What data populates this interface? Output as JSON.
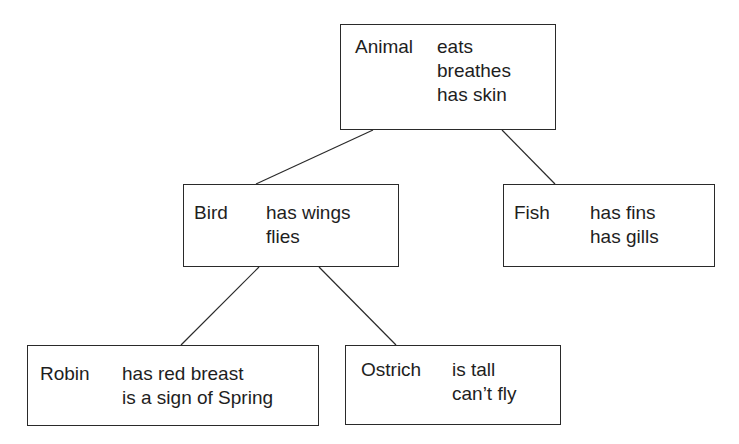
{
  "diagram": {
    "type": "hierarchy-tree",
    "nodes": {
      "animal": {
        "name": "Animal",
        "properties": [
          "eats",
          "breathes",
          "has skin"
        ]
      },
      "bird": {
        "name": "Bird",
        "properties": [
          "has wings",
          "flies"
        ]
      },
      "fish": {
        "name": "Fish",
        "properties": [
          "has fins",
          "has gills"
        ]
      },
      "robin": {
        "name": "Robin",
        "properties": [
          "has red breast",
          "is a sign of Spring"
        ]
      },
      "ostrich": {
        "name": "Ostrich",
        "properties": [
          "is tall",
          "can’t fly"
        ]
      }
    },
    "edges": [
      {
        "from": "Animal",
        "to": "Bird"
      },
      {
        "from": "Animal",
        "to": "Fish"
      },
      {
        "from": "Bird",
        "to": "Robin"
      },
      {
        "from": "Bird",
        "to": "Ostrich"
      }
    ],
    "colors": {
      "background": "#ffffff",
      "stroke": "#2a2a2a",
      "text": "#1e1e1e"
    }
  }
}
